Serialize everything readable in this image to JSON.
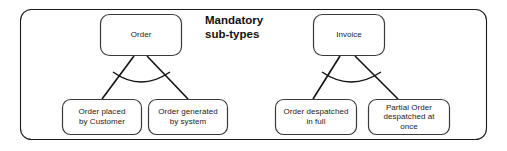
{
  "diagram": {
    "title": "Mandatory\nsub-types",
    "title_line1": "Mandatory",
    "title_line2": "sub-types",
    "notation": "mandatory-subtype-arc",
    "stroke_color": "#1a1a1a",
    "fill_color": "#ffffff",
    "container": {
      "label": "diagram-container",
      "x": 20,
      "y": 9,
      "width": 467,
      "height": 131,
      "radius": 11
    },
    "groups": [
      {
        "name": "order-group",
        "parent": {
          "id": "order",
          "label": "Order",
          "x": 100,
          "y": 14,
          "width": 82,
          "height": 42,
          "radius": 9
        },
        "children": [
          {
            "id": "order-placed-by-customer",
            "label": "Order placed\nby Customer",
            "x": 62,
            "y": 99,
            "width": 80,
            "height": 36,
            "radius": 8
          },
          {
            "id": "order-generated-by-system",
            "label": "Order generated\nby system",
            "x": 148,
            "y": 99,
            "width": 80,
            "height": 36,
            "radius": 8
          }
        ],
        "arc": {
          "x1": 113,
          "y1": 79,
          "x2": 169,
          "y2": 79,
          "sag": 11
        }
      },
      {
        "name": "invoice-group",
        "parent": {
          "id": "invoice",
          "label": "Invoice",
          "x": 313,
          "y": 14,
          "width": 72,
          "height": 42,
          "radius": 9
        },
        "children": [
          {
            "id": "order-despatched-in-full",
            "label": "Order despatched\nin full",
            "x": 275,
            "y": 99,
            "width": 82,
            "height": 36,
            "radius": 8
          },
          {
            "id": "partial-order-despatched-at-once",
            "label": "Partial Order\ndespatched at\nonce",
            "x": 368,
            "y": 99,
            "width": 82,
            "height": 36,
            "radius": 8
          }
        ],
        "arc": {
          "x1": 324,
          "y1": 79,
          "x2": 380,
          "y2": 79,
          "sag": 11
        }
      }
    ],
    "title_position": {
      "x": 205,
      "y": 15
    }
  }
}
